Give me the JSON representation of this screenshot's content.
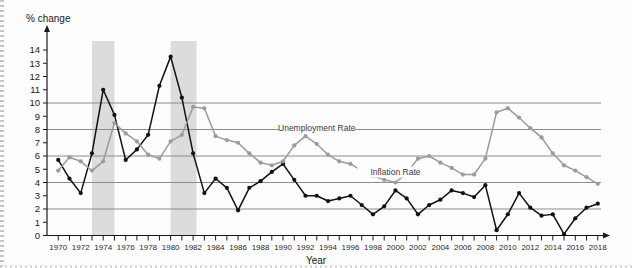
{
  "figure": {
    "background": "#fdfdfd",
    "y_axis_title": "% change",
    "x_axis_title": "Year"
  },
  "chart_data": {
    "type": "line",
    "title": "",
    "subtitle": "",
    "xlabel": "Year",
    "ylabel": "% change",
    "xlim": [
      1969,
      2019
    ],
    "ylim": [
      0,
      14.6
    ],
    "grid": true,
    "gridlines_y": [
      2,
      4,
      6,
      8,
      10
    ],
    "y_ticks": [
      0,
      1,
      2,
      3,
      4,
      5,
      6,
      7,
      8,
      9,
      10,
      11,
      12,
      13,
      14
    ],
    "x_ticks": [
      1970,
      1971,
      1972,
      1973,
      1974,
      1975,
      1976,
      1977,
      1978,
      1979,
      1980,
      1981,
      1982,
      1983,
      1984,
      1985,
      1986,
      1987,
      1988,
      1989,
      1990,
      1991,
      1992,
      1993,
      1994,
      1995,
      1996,
      1997,
      1998,
      1999,
      2000,
      2001,
      2002,
      2003,
      2004,
      2005,
      2006,
      2007,
      2008,
      2009,
      2010,
      2011,
      2012,
      2013,
      2014,
      2015,
      2016,
      2017,
      2018
    ],
    "x_tick_labels": [
      1970,
      1972,
      1974,
      1976,
      1978,
      1980,
      1982,
      1984,
      1986,
      1988,
      1990,
      1992,
      1994,
      1996,
      1998,
      2000,
      2002,
      2004,
      2006,
      2008,
      2010,
      2012,
      2014,
      2016,
      2018
    ],
    "legend_position": "inline-annotation",
    "x": [
      1970,
      1971,
      1972,
      1973,
      1974,
      1975,
      1976,
      1977,
      1978,
      1979,
      1980,
      1981,
      1982,
      1983,
      1984,
      1985,
      1986,
      1987,
      1988,
      1989,
      1990,
      1991,
      1992,
      1993,
      1994,
      1995,
      1996,
      1997,
      1998,
      1999,
      2000,
      2001,
      2002,
      2003,
      2004,
      2005,
      2006,
      2007,
      2008,
      2009,
      2010,
      2011,
      2012,
      2013,
      2014,
      2015,
      2016,
      2017,
      2018
    ],
    "series": [
      {
        "name": "Inflation Rate",
        "color": "#111111",
        "marker": "circle",
        "label_x": 2000,
        "label_y": 4.6,
        "values": [
          5.7,
          4.3,
          3.2,
          6.2,
          11.0,
          9.1,
          5.7,
          6.5,
          7.6,
          11.3,
          13.5,
          10.4,
          6.2,
          3.2,
          4.3,
          3.6,
          1.9,
          3.6,
          4.1,
          4.8,
          5.4,
          4.2,
          3.0,
          3.0,
          2.6,
          2.8,
          3.0,
          2.3,
          1.6,
          2.2,
          3.4,
          2.8,
          1.6,
          2.3,
          2.7,
          3.4,
          3.2,
          2.9,
          3.8,
          0.4,
          1.6,
          3.2,
          2.1,
          1.5,
          1.6,
          0.1,
          1.3,
          2.1,
          2.4
        ]
      },
      {
        "name": "Unemployment Rate",
        "color": "#9b9b9b",
        "marker": "circle",
        "label_x": 1993,
        "label_y": 7.9,
        "values": [
          4.9,
          5.9,
          5.6,
          4.9,
          5.6,
          8.5,
          7.7,
          7.1,
          6.1,
          5.8,
          7.1,
          7.6,
          9.7,
          9.6,
          7.5,
          7.2,
          7.0,
          6.2,
          5.5,
          5.3,
          5.6,
          6.8,
          7.5,
          6.9,
          6.1,
          5.6,
          5.4,
          4.9,
          4.5,
          4.2,
          4.0,
          4.7,
          5.8,
          6.0,
          5.5,
          5.1,
          4.6,
          4.6,
          5.8,
          9.3,
          9.6,
          8.9,
          8.1,
          7.4,
          6.2,
          5.3,
          4.9,
          4.4,
          3.9
        ]
      }
    ],
    "shaded_bands": [
      {
        "name": "recession-band-1973-1975",
        "x0": 1973,
        "x1": 1975
      },
      {
        "name": "recession-band-1980-1982",
        "x0": 1980,
        "x1": 1982.3
      }
    ]
  }
}
